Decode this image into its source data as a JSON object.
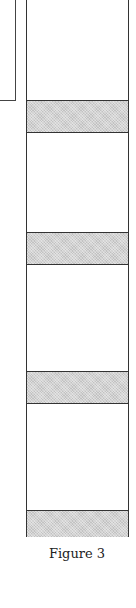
{
  "figure": {
    "caption": "Figure 3",
    "colors": {
      "band_fill": "#d2d2d2",
      "stroke": "#333333",
      "background": "#ffffff"
    },
    "bands": [
      {
        "top": 102,
        "height": 32
      },
      {
        "top": 234,
        "height": 32
      },
      {
        "top": 373,
        "height": 32
      },
      {
        "top": 512,
        "height": 26
      }
    ]
  }
}
